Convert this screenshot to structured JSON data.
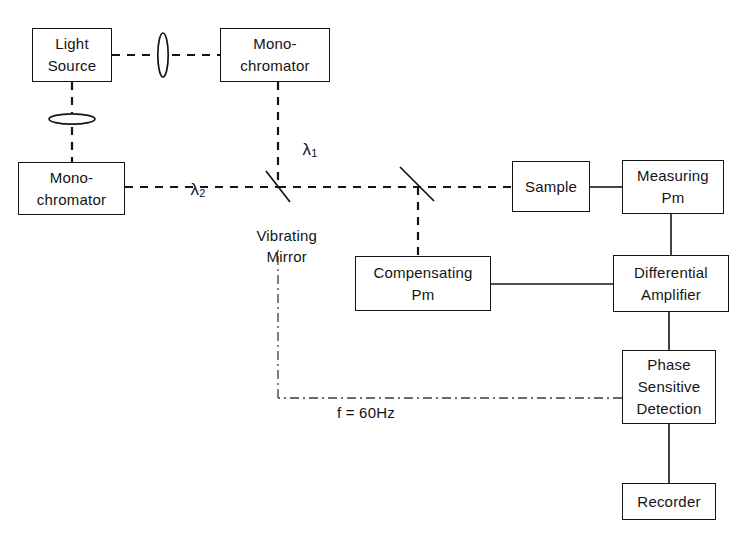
{
  "diagram": {
    "stroke_color": "#141414",
    "background_color": "#ffffff",
    "blocks": [
      {
        "id": "light-source",
        "lines": [
          "Light",
          "Source"
        ]
      },
      {
        "id": "monochromator-top",
        "lines": [
          "Mono-",
          "chromator"
        ]
      },
      {
        "id": "monochromator-left",
        "lines": [
          "Mono-",
          "chromator"
        ]
      },
      {
        "id": "sample",
        "lines": [
          "Sample"
        ]
      },
      {
        "id": "measuring-pm",
        "lines": [
          "Measuring",
          "Pm"
        ]
      },
      {
        "id": "compensating-pm",
        "lines": [
          "Compensating",
          "Pm"
        ]
      },
      {
        "id": "differential-amplifier",
        "lines": [
          "Differential",
          "Amplifier"
        ]
      },
      {
        "id": "phase-sensitive-detection",
        "lines": [
          "Phase",
          "Sensitive",
          "Detection"
        ]
      },
      {
        "id": "recorder",
        "lines": [
          "Recorder"
        ]
      }
    ],
    "annotations": {
      "lambda_1": "λ",
      "lambda_1_sub": "1",
      "lambda_2": "λ",
      "lambda_2_sub": "2",
      "vibrating_mirror_line_1": "Vibrating",
      "vibrating_mirror_line_2": "Mirror",
      "frequency": "f = 60Hz"
    },
    "optics": [
      {
        "id": "lens-vertical",
        "name": "lens-vertical-icon",
        "orientation": "vertical"
      },
      {
        "id": "lens-horizontal",
        "name": "lens-horizontal-icon",
        "orientation": "horizontal"
      },
      {
        "id": "vibrating-mirror",
        "name": "vibrating-mirror-icon",
        "orientation": "diagonal"
      },
      {
        "id": "beam-splitter",
        "name": "beam-splitter-icon",
        "orientation": "diagonal"
      }
    ],
    "connections": [
      {
        "from": "light-source",
        "to": "monochromator-top",
        "style": "dashed-optical-beam"
      },
      {
        "from": "light-source",
        "to": "monochromator-left",
        "style": "dashed-optical-beam"
      },
      {
        "from": "monochromator-top",
        "to": "vibrating-mirror",
        "style": "dashed-optical-beam",
        "label": "λ1"
      },
      {
        "from": "monochromator-left",
        "to": "vibrating-mirror",
        "style": "dashed-optical-beam",
        "label": "λ2"
      },
      {
        "from": "vibrating-mirror",
        "to": "sample",
        "style": "dashed-optical-beam"
      },
      {
        "from": "beam-splitter",
        "to": "compensating-pm",
        "style": "dashed-optical-beam"
      },
      {
        "from": "sample",
        "to": "measuring-pm",
        "style": "solid-electrical"
      },
      {
        "from": "measuring-pm",
        "to": "differential-amplifier",
        "style": "solid-electrical"
      },
      {
        "from": "compensating-pm",
        "to": "differential-amplifier",
        "style": "solid-electrical"
      },
      {
        "from": "differential-amplifier",
        "to": "phase-sensitive-detection",
        "style": "solid-electrical"
      },
      {
        "from": "phase-sensitive-detection",
        "to": "recorder",
        "style": "solid-electrical"
      },
      {
        "from": "phase-sensitive-detection",
        "to": "vibrating-mirror",
        "style": "dash-dot-reference",
        "label": "f = 60Hz"
      }
    ]
  }
}
